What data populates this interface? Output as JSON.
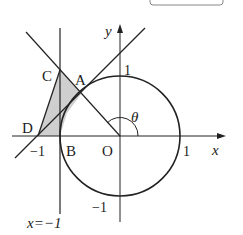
{
  "figure": {
    "type": "coordinate-geometry-diagram",
    "box_label": "",
    "axes": {
      "x_label": "x",
      "y_label": "y",
      "origin_label": "O"
    },
    "ticks": {
      "x_pos": "1",
      "x_neg": "−1",
      "y_pos": "1",
      "y_neg": "−1"
    },
    "points": {
      "A": "A",
      "B": "B",
      "C": "C",
      "D": "D"
    },
    "angle_label": "θ",
    "vertical_line_label": "x=−1",
    "shaded_region": "triangle CDB-side region (C, D, A-segment)",
    "colors": {
      "stroke": "#222222",
      "shade": "#cfcfcf"
    }
  }
}
